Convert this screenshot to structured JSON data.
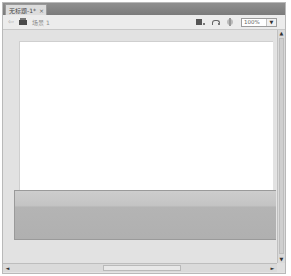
{
  "window": {
    "tab": {
      "title": "无标题-1*",
      "close_glyph": "×"
    },
    "toolbar": {
      "back_glyph": "⇦",
      "scene_label": "场景 1",
      "zoom": {
        "value": "100%",
        "dropdown_glyph": "▼"
      }
    },
    "scrollbars": {
      "up_glyph": "▲",
      "down_glyph": "▼",
      "left_glyph": "◄",
      "right_glyph": "►"
    },
    "colors": {
      "tabbar": "#858585",
      "workarea": "#e2e2e2",
      "stage": "#ffffff",
      "gradient_top": "#cdcdcd",
      "gradient_bottom": "#b0b0b0"
    }
  }
}
